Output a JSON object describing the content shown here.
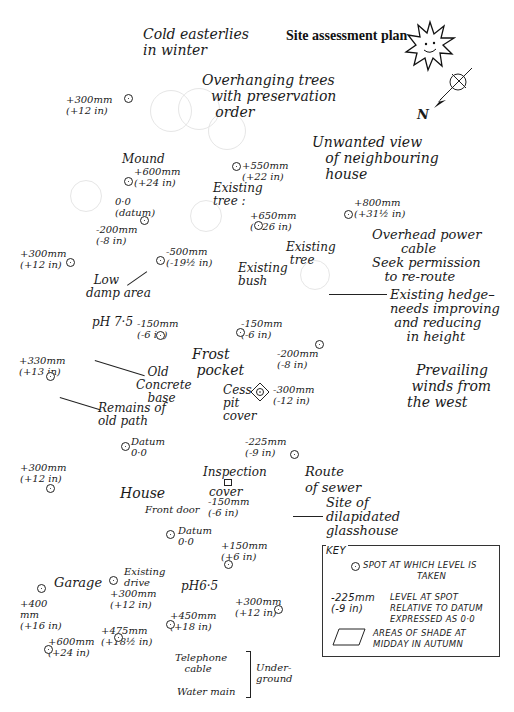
{
  "title": "Site assessment plan",
  "compass": {
    "north_label": "N",
    "sun_icon": "sun-face-icon"
  },
  "notes": {
    "cold_winds": "Cold easterlies\nin winter",
    "overhanging_trees": "Overhanging trees\n  with preservation\n   order",
    "unwanted_view": "Unwanted view\n   of neighbouring\n   house",
    "power_cable": "Overhead power\n       cable\nSeek permission\n   to re-route",
    "hedge": "Existing hedge–\nneeds improving\n and reducing\n    in height",
    "prevailing_winds": "  Prevailing\n winds from\nthe west",
    "mound": "Mound",
    "existing_tree_1": "Existing\ntree :",
    "existing_tree_2": "Existing\n tree",
    "existing_bush": "Existing\nbush",
    "low_damp": "  Low\ndamp area",
    "ph75": "pH 7·5",
    "frost_pocket": "Frost\n pocket",
    "old_concrete": "   Old\nConcrete\n   base",
    "old_path": "Remains of\nold path",
    "cesspit": "Cess-\npit\ncover",
    "inspection": "Inspection",
    "inspection_cover": "cover",
    "route_sewer": "Route\nof sewer",
    "house": "House",
    "front_door": "Front door",
    "glasshouse": "Site of\ndilapidated\nglasshouse",
    "garage": "Garage",
    "existing_drive": "Existing\ndrive",
    "ph65": "pH6·5",
    "telephone": "Telephone\n   cable",
    "water_main": "Water main",
    "underground": "Under-\nground"
  },
  "levels": [
    {
      "id": "l1",
      "text": "+300mm\n(+12 in)"
    },
    {
      "id": "l2",
      "text": "+600mm\n(+24 in)"
    },
    {
      "id": "l3",
      "text": "+550mm\n(+22 in)"
    },
    {
      "id": "l4",
      "text": "0·0\n(datum)"
    },
    {
      "id": "l5",
      "text": "-200mm\n(-8 in)"
    },
    {
      "id": "l6",
      "text": "+650mm\n(+26 in)"
    },
    {
      "id": "l7",
      "text": "+800mm\n(+31½ in)"
    },
    {
      "id": "l8",
      "text": "+300mm\n(+12 in)"
    },
    {
      "id": "l9",
      "text": "-500mm\n(-19½ in)"
    },
    {
      "id": "l10",
      "text": "-150mm\n(-6 in)"
    },
    {
      "id": "l11",
      "text": "-150mm\n(-6 in)"
    },
    {
      "id": "l12",
      "text": "-200mm\n(-8 in)"
    },
    {
      "id": "l13",
      "text": "+330mm\n(+13 in)"
    },
    {
      "id": "l14",
      "text": "-300mm\n(-12 in)"
    },
    {
      "id": "l15",
      "text": "Datum\n0·0"
    },
    {
      "id": "l16",
      "text": "-225mm\n(-9 in)"
    },
    {
      "id": "l17",
      "text": "+300mm\n(+12 in)"
    },
    {
      "id": "l18",
      "text": "-150mm\n(-6 in)"
    },
    {
      "id": "l19",
      "text": "Datum\n0·0"
    },
    {
      "id": "l20",
      "text": "+150mm\n(+6 in)"
    },
    {
      "id": "l21",
      "text": "+300mm\n(+12 in)"
    },
    {
      "id": "l22",
      "text": "+400\nmm\n(+16 in)"
    },
    {
      "id": "l23",
      "text": "+300mm\n(+12 in)"
    },
    {
      "id": "l24",
      "text": "+450mm\n(+18 in)"
    },
    {
      "id": "l25",
      "text": "+475mm\n(+18½ in)"
    },
    {
      "id": "l26",
      "text": "+600mm\n(+24 in)"
    }
  ],
  "key": {
    "title": "KEY",
    "items": [
      {
        "symbol": "spot-icon",
        "text": "SPOT AT WHICH LEVEL IS\n                  TAKEN"
      },
      {
        "sample": "-225mm\n(-9 in)",
        "text": "LEVEL AT SPOT\nRELATIVE TO DATUM\nEXPRESSED AS 0·0"
      },
      {
        "symbol": "shade-parallelogram-icon",
        "text": "AREAS OF SHADE AT\nMIDDAY IN AUTUMN"
      }
    ]
  }
}
